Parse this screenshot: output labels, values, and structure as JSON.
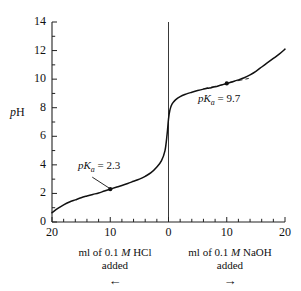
{
  "chart_data": {
    "type": "line",
    "title": "",
    "xlabel_left": "ml of 0.1 M HCl added",
    "xlabel_right": "ml of 0.1 M NaOH added",
    "ylabel": "pH",
    "ylim": [
      0,
      14
    ],
    "ytick_labels": [
      "0",
      "2",
      "4",
      "6",
      "8",
      "10",
      "12",
      "14"
    ],
    "ytick_values": [
      0,
      2,
      4,
      6,
      8,
      10,
      12,
      14
    ],
    "yminor_step": 1,
    "xtick_labels": [
      "20",
      "10",
      "0",
      "10",
      "20"
    ],
    "xtick_values": [
      -20,
      -10,
      0,
      10,
      20
    ],
    "xminor_step": 2,
    "xlim": [
      -20,
      20
    ],
    "grid": false,
    "legend": "none",
    "series": [
      {
        "name": "titration curve",
        "x": [
          -20,
          -19,
          -18,
          -17,
          -16,
          -15,
          -14,
          -13,
          -12,
          -11,
          -10,
          -9,
          -8,
          -7,
          -6,
          -5,
          -4,
          -3,
          -2,
          -1.2,
          -0.6,
          -0.25,
          0,
          0.25,
          0.6,
          1.2,
          2,
          3,
          4,
          5,
          6,
          7,
          8,
          9,
          10,
          11,
          12,
          13,
          14,
          15,
          16,
          17,
          18,
          19,
          20
        ],
        "y": [
          0.65,
          0.95,
          1.2,
          1.4,
          1.55,
          1.7,
          1.82,
          1.93,
          2.03,
          2.17,
          2.3,
          2.43,
          2.56,
          2.7,
          2.85,
          3.0,
          3.2,
          3.45,
          3.85,
          4.3,
          5.0,
          6.1,
          7.2,
          7.85,
          8.25,
          8.55,
          8.78,
          8.95,
          9.08,
          9.2,
          9.3,
          9.38,
          9.46,
          9.58,
          9.7,
          9.82,
          9.95,
          10.1,
          10.3,
          10.55,
          10.85,
          11.15,
          11.45,
          11.75,
          12.1
        ]
      }
    ],
    "annotations": [
      {
        "label": "pK",
        "sub": "a",
        "eq": "= 2.3",
        "point_x": -10,
        "point_y": 2.3,
        "marker": true
      },
      {
        "label": "pK",
        "sub": "a",
        "eq": "= 9.7",
        "point_x": 10,
        "point_y": 9.7,
        "marker": true
      }
    ],
    "reference_line_x": 0
  },
  "axes": {
    "ylabel": "pH",
    "ylabel_italic_p": "p",
    "ylabel_roman_h": "H"
  },
  "captions": {
    "left": {
      "line1_a": "ml of 0.1 ",
      "line1_m": "M",
      "line1_b": " HCl",
      "line2": "added",
      "arrow": "←",
      "arrow_name": "left-arrow"
    },
    "right": {
      "line1_a": "ml of 0.1 ",
      "line1_m": "M",
      "line1_b": " NaOH",
      "line2": "added",
      "arrow": "→",
      "arrow_name": "right-arrow"
    }
  },
  "annotation_text": {
    "pka_left_p": "p",
    "pka_left_k": "K",
    "pka_left_sub": "a",
    "pka_left_eq": "= 2.3",
    "pka_right_p": "p",
    "pka_right_k": "K",
    "pka_right_sub": "a",
    "pka_right_eq": "= 9.7"
  },
  "colors": {
    "curve": "#111111",
    "axis": "#222222",
    "text": "#1a1a1a",
    "background": "#ffffff"
  }
}
